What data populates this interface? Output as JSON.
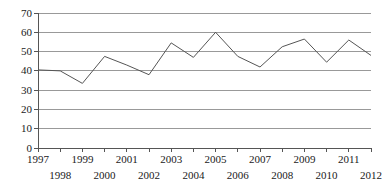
{
  "chart_data": {
    "type": "line",
    "title": "",
    "subtitle": "",
    "xlabel": "",
    "ylabel": "",
    "categories": [
      "1997",
      "1998",
      "1999",
      "2000",
      "2001",
      "2002",
      "2003",
      "2004",
      "2005",
      "2006",
      "2007",
      "2008",
      "2009",
      "2010",
      "2011",
      "2012"
    ],
    "x": [
      1997,
      1998,
      1999,
      2000,
      2001,
      2002,
      2003,
      2004,
      2005,
      2006,
      2007,
      2008,
      2009,
      2010,
      2011,
      2012
    ],
    "values": [
      40.5,
      40.0,
      33.5,
      47.5,
      43.0,
      38.0,
      54.5,
      47.0,
      60.0,
      47.5,
      42.0,
      52.5,
      56.5,
      44.5,
      56.0,
      48.0
    ],
    "series": [
      {
        "name": "",
        "values": [
          40.5,
          40.0,
          33.5,
          47.5,
          43.0,
          38.0,
          54.5,
          47.0,
          60.0,
          47.5,
          42.0,
          52.5,
          56.5,
          44.5,
          56.0,
          48.0
        ]
      }
    ],
    "ylim": [
      0,
      70
    ],
    "xlim": [
      1997,
      2012
    ],
    "yticks": [
      0,
      10,
      20,
      30,
      40,
      50,
      60,
      70
    ],
    "ytick_labels": [
      "0",
      "10",
      "20",
      "30",
      "40",
      "50",
      "60",
      "70"
    ],
    "xtick_labels_top": [
      "1997",
      "1999",
      "2001",
      "2003",
      "2005",
      "2007",
      "2009",
      "2011"
    ],
    "xtick_labels_bottom": [
      "1998",
      "2000",
      "2002",
      "2004",
      "2006",
      "2008",
      "2010",
      "2012"
    ],
    "grid": true,
    "grid_axis": "y",
    "legend": false,
    "legend_position": "none",
    "annotations": [],
    "colors": {
      "line": "#555555",
      "grid": "#999999",
      "axis": "#555555",
      "text": "#1a1a1a",
      "background": "#ffffff"
    }
  }
}
